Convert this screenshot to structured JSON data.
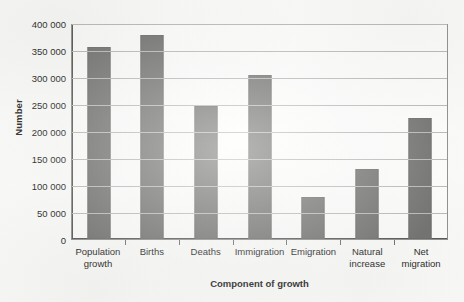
{
  "chart_data": {
    "type": "bar",
    "title": "",
    "xlabel": "Component of growth",
    "ylabel": "Number",
    "categories": [
      "Population growth",
      "Births",
      "Deaths",
      "Immigration",
      "Emigration",
      "Natural increase",
      "Net migration"
    ],
    "category_lines": [
      [
        "Population",
        "growth"
      ],
      [
        "Births"
      ],
      [
        "Deaths"
      ],
      [
        "Immigration"
      ],
      [
        "Emigration"
      ],
      [
        "Natural",
        "increase"
      ],
      [
        "Net",
        "migration"
      ]
    ],
    "values": [
      356000,
      378000,
      246000,
      304000,
      78000,
      130000,
      224000
    ],
    "ylim": [
      0,
      400000
    ],
    "ytick_values": [
      0,
      50000,
      100000,
      150000,
      200000,
      250000,
      300000,
      350000,
      400000
    ],
    "ytick_labels": [
      "0",
      "50 000",
      "100 000",
      "150 000",
      "200 000",
      "250 000",
      "300 000",
      "350 000",
      "400 000"
    ],
    "grid": true,
    "legend": "none",
    "bar_color": "#70706e",
    "grid_color": "#b9b9b9",
    "axis_color": "#555555",
    "background_color": "#fbfbf9"
  }
}
